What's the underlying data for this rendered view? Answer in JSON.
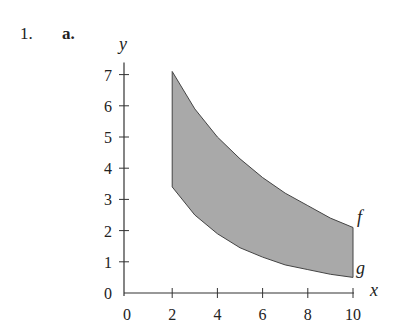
{
  "problem": {
    "number": "1.",
    "part": "a."
  },
  "chart_data": {
    "type": "area",
    "title": "",
    "xlabel": "x",
    "ylabel": "y",
    "xlim": [
      0,
      10
    ],
    "ylim": [
      0,
      7
    ],
    "x_ticks": [
      "0",
      "2",
      "4",
      "6",
      "8",
      "10"
    ],
    "y_ticks": [
      "0",
      "1",
      "2",
      "3",
      "4",
      "5",
      "6",
      "7"
    ],
    "grid": false,
    "legend": "none",
    "series": [
      {
        "name": "f",
        "x": [
          2,
          3,
          4,
          5,
          6,
          7,
          8,
          9,
          10
        ],
        "values": [
          7.1,
          5.9,
          5.0,
          4.3,
          3.7,
          3.2,
          2.8,
          2.4,
          2.1
        ]
      },
      {
        "name": "g",
        "x": [
          2,
          3,
          4,
          5,
          6,
          7,
          8,
          9,
          10
        ],
        "values": [
          3.4,
          2.5,
          1.9,
          1.45,
          1.15,
          0.9,
          0.75,
          0.6,
          0.5
        ]
      }
    ],
    "shaded_region": "between f and g for 2 ≤ x ≤ 10",
    "annotations": [
      "f",
      "g"
    ],
    "fill_color": "#a9a9a9"
  }
}
